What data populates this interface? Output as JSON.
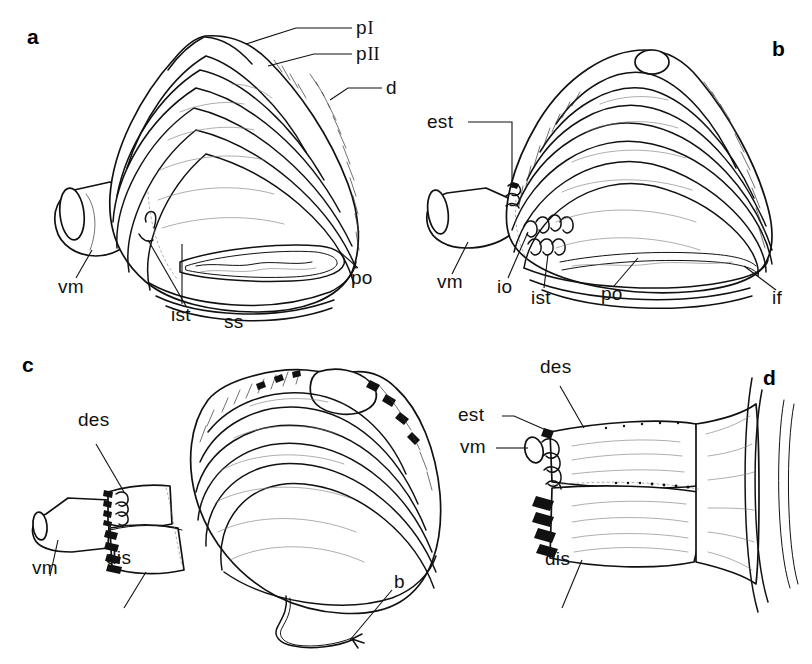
{
  "figure": {
    "background_color": "#ffffff",
    "ink_color": "#111111",
    "width": 812,
    "height": 664
  },
  "panels": [
    {
      "id": "a",
      "letter": "a",
      "caption": "Left lateral view of shell with extended ventral mantle",
      "labels": [
        {
          "key": "p1",
          "text": "p",
          "roman": "I",
          "name": "label-p-one"
        },
        {
          "key": "p2",
          "text": "p",
          "roman": "II",
          "name": "label-p-two"
        },
        {
          "key": "d",
          "text": "d",
          "name": "label-d"
        },
        {
          "key": "vm",
          "text": "vm",
          "name": "label-vm"
        },
        {
          "key": "ist",
          "text": "ist",
          "name": "label-ist"
        },
        {
          "key": "ss",
          "text": "ss",
          "name": "label-ss"
        },
        {
          "key": "po",
          "text": "po",
          "name": "label-po"
        }
      ]
    },
    {
      "id": "b",
      "letter": "b",
      "caption": "Right lateral view showing exhalant siphon and inner fold",
      "labels": [
        {
          "key": "est",
          "text": "est",
          "name": "label-est"
        },
        {
          "key": "vm",
          "text": "vm",
          "name": "label-vm"
        },
        {
          "key": "io",
          "text": "io",
          "name": "label-io"
        },
        {
          "key": "ist",
          "text": "ist",
          "name": "label-ist"
        },
        {
          "key": "po",
          "text": "po",
          "name": "label-po"
        },
        {
          "key": "if",
          "text": "if",
          "name": "label-if"
        }
      ]
    },
    {
      "id": "c",
      "letter": "c",
      "caption": "Oblique view with byssal thread and siphonal discs",
      "labels": [
        {
          "key": "des",
          "text": "des",
          "name": "label-des"
        },
        {
          "key": "vm",
          "text": "vm",
          "name": "label-vm"
        },
        {
          "key": "dis",
          "text": "dis",
          "name": "label-dis"
        },
        {
          "key": "b",
          "text": "b",
          "name": "label-b"
        }
      ]
    },
    {
      "id": "d",
      "letter": "d",
      "caption": "Detail of siphon base showing exhalant and inhalant discs",
      "labels": [
        {
          "key": "des",
          "text": "des",
          "name": "label-des"
        },
        {
          "key": "est",
          "text": "est",
          "name": "label-est"
        },
        {
          "key": "vm",
          "text": "vm",
          "name": "label-vm"
        },
        {
          "key": "dis",
          "text": "dis",
          "name": "label-dis"
        }
      ]
    }
  ],
  "legend_keys": {
    "p_one": "p I",
    "p_two": "p II",
    "d": "d",
    "vm": "vm",
    "ist": "ist",
    "ss": "ss",
    "po": "po",
    "est": "est",
    "io": "io",
    "if": "if",
    "des": "des",
    "dis": "dis",
    "b": "b"
  }
}
